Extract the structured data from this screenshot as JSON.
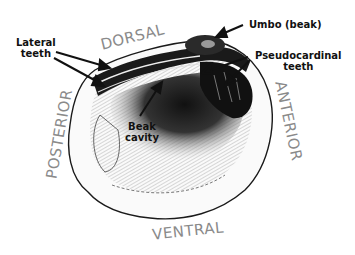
{
  "diagram": {
    "orientation_labels": {
      "dorsal": "DORSAL",
      "ventral": "VENTRAL",
      "anterior": "ANTERIOR",
      "posterior": "POSTERIOR"
    },
    "annotations": {
      "umbo": "Umbo (beak)",
      "lateral_teeth_line1": "Lateral",
      "lateral_teeth_line2": "teeth",
      "pseudocardinal_line1": "Pseudocardinal",
      "pseudocardinal_line2": "teeth",
      "beak_cavity_line1": "Beak",
      "beak_cavity_line2": "cavity"
    },
    "colors": {
      "label_text": "#111111",
      "orientation_text": "#8a8a8a",
      "outline": "#1a1a1a",
      "background": "#ffffff"
    }
  }
}
